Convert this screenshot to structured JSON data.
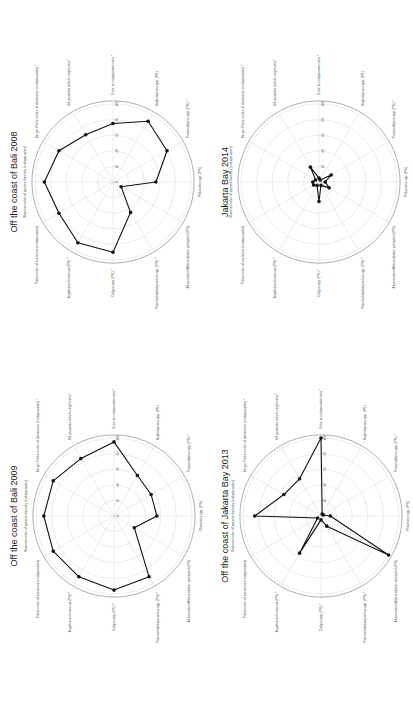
{
  "axes": [
    "Ecto- to endoparasite ratio *",
    "Raphidascaris spp. (P%)",
    "Procamallanus spp. (P%) *",
    "Philometra spp. (P%)",
    "Allocreadium/Allocreadiidae epinepheli (P%)",
    "Pseudorhabdosynochus spp. (P%) *",
    "Caligus spp. (P%) *",
    "Argathona rhinoceros (P%) *",
    "Pielou index of evenness (endoparasites)",
    "Shannon index of species diversity (endoparasites)",
    "Berger-Parker index of dominance (endoparasites) *",
    "Gill parasites to fish weight ratio *"
  ],
  "ticks": [
    "0",
    "20",
    "40",
    "60",
    "80",
    "100"
  ],
  "chart_data": [
    {
      "type": "radar",
      "title": "Off the coast of Bali 2008",
      "categories": [
        "Ecto- to endoparasite ratio *",
        "Raphidascaris spp. (P%)",
        "Procamallanus spp. (P%) *",
        "Philometra spp. (P%)",
        "Allocreadium epinepheli (P%)",
        "Pseudorhabdosynochus spp. (P%) *",
        "Caligus spp. (P%) *",
        "Argathona rhinoceros (P%) *",
        "Pielou index of evenness (endoparasites)",
        "Shannon index of species diversity (endoparasites)",
        "Berger-Parker index of dominance (endoparasites) *",
        "Gill parasites to fish weight ratio *"
      ],
      "values": [
        75,
        90,
        80,
        55,
        12,
        45,
        90,
        90,
        80,
        88,
        80,
        70
      ],
      "rlim": [
        0,
        100
      ],
      "rticks": [
        0,
        20,
        40,
        60,
        80,
        100
      ]
    },
    {
      "type": "radar",
      "title": "Jakarta Bay 2014",
      "categories": [
        "Ecto- to endoparasite ratio *",
        "Raphidascaris spp. (P%)",
        "Procamallanus spp. (P%) *",
        "Philometra spp. (P%)",
        "Allocreadium epinepheli (P%)",
        "Pseudorhabdosynochus spp. (P%) *",
        "Caligus spp. (P%) *",
        "Argathona rhinoceros (P%) *",
        "Pielou index of evenness (endoparasites)",
        "Shannon index of species diversity (endoparasites)",
        "Berger-Parker index of dominance (endoparasites) *",
        "Gill parasites to fish weight ratio *"
      ],
      "values": [
        5,
        3,
        18,
        8,
        15,
        5,
        25,
        5,
        8,
        8,
        5,
        22
      ],
      "rlim": [
        0,
        100
      ],
      "rticks": [
        0,
        20,
        40,
        60,
        80,
        100
      ]
    },
    {
      "type": "radar",
      "title": "Off the coast of Bali 2009",
      "categories": [
        "Ecto- to endoparasite ratio *",
        "Raphidascaris spp. (P%)",
        "Procamallanus spp. (P%) *",
        "Philometra spp. (P%)",
        "Allocreadium epinepheli (P%)",
        "Pseudorhabdosynochus spp. (P%) *",
        "Caligus spp. (P%) *",
        "Argathona rhinoceros (P%) *",
        "Pielou index of evenness (endoparasites)",
        "Shannon index of species diversity (endoparasites)",
        "Berger-Parker index of dominance (endoparasites) *",
        "Gill parasites to fish weight ratio *"
      ],
      "values": [
        95,
        60,
        55,
        55,
        30,
        90,
        95,
        90,
        90,
        90,
        90,
        85
      ],
      "rlim": [
        0,
        100
      ],
      "rticks": [
        0,
        20,
        40,
        60,
        80,
        100
      ]
    },
    {
      "type": "radar",
      "title": "Off the coast of Jakarta Bay 2013",
      "categories": [
        "Ecto- to endoparasite ratio *",
        "Raphidascaris spp. (P%)",
        "Procamallanus spp. (P%) *",
        "Philometra spp. (P%)",
        "Allocreadium epinepheli (P%)",
        "Pseudorhabdosynochus spp. (P%) *",
        "Caligus spp. (P%) *",
        "Argathona rhinoceros (P%) *",
        "Pielou index of evenness (endoparasites)",
        "Shannon index of species diversity (endoparasites)",
        "Berger-Parker index of dominance (endoparasites) *",
        "Gill parasites to fish weight ratio *"
      ],
      "values": [
        100,
        3,
        3,
        12,
        100,
        15,
        5,
        55,
        5,
        85,
        55,
        55
      ],
      "rlim": [
        0,
        100
      ],
      "rticks": [
        0,
        20,
        40,
        60,
        80,
        100
      ]
    }
  ],
  "panels": [
    {
      "title": "Off the coast of Bali 2008"
    },
    {
      "title": "Jakarta Bay 2014"
    },
    {
      "title": "Off the coast of Bali 2009"
    },
    {
      "title": "Off the coast of Jakarta Bay 2013"
    }
  ]
}
